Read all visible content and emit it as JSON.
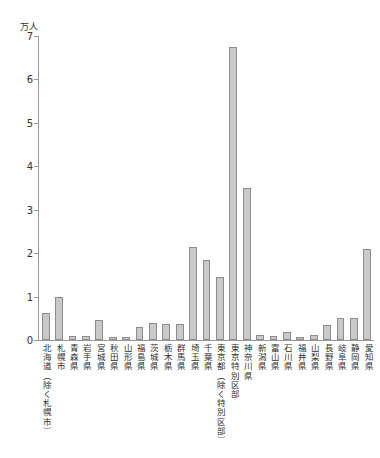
{
  "chart_data": {
    "type": "bar",
    "title": "",
    "subtitle": "",
    "xlabel": "",
    "ylabel": "万人",
    "unit_label": "万人",
    "ylim": [
      0,
      7
    ],
    "ytick_labels": [
      "0",
      "1",
      "2",
      "3",
      "4",
      "5",
      "6",
      "7"
    ],
    "ytick_values": [
      0,
      1,
      2,
      3,
      4,
      5,
      6,
      7
    ],
    "grid": false,
    "legend": "none",
    "bar_color": "#c9c9c9",
    "bar_edge_color": "#8d8d8d",
    "axis_color": "#9a9a9a",
    "categories": [
      "北海道（除く札幌市）",
      "札幌市",
      "青森県",
      "岩手県",
      "宮城県",
      "秋田県",
      "山形県",
      "福島県",
      "茨城県",
      "栃木県",
      "群馬県",
      "埼玉県",
      "千葉県",
      "東京都（除く特別区部）",
      "東京特別区部",
      "神奈川県",
      "新潟県",
      "富山県",
      "石川県",
      "福井県",
      "山梨県",
      "長野県",
      "岐阜県",
      "静岡県",
      "愛知県"
    ],
    "values": [
      0.62,
      0.98,
      0.1,
      0.1,
      0.45,
      0.08,
      0.07,
      0.3,
      0.4,
      0.38,
      0.38,
      2.15,
      1.85,
      1.45,
      6.75,
      3.5,
      0.12,
      0.1,
      0.18,
      0.07,
      0.12,
      0.35,
      0.5,
      0.5,
      2.1
    ]
  },
  "footer": {
    "note": "",
    "page_mark": ""
  }
}
